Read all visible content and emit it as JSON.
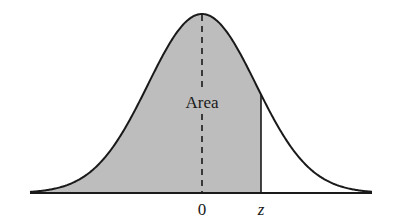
{
  "chart_data": {
    "type": "area",
    "title": "",
    "distribution": {
      "name": "standard normal",
      "mean": 0,
      "sd": 1
    },
    "shaded_region": {
      "from": "-inf",
      "to": "z"
    },
    "xlabel": "",
    "ylabel": "",
    "tick_labels": [
      "0",
      "z"
    ],
    "annotation": "Area",
    "grid": false,
    "legend": null,
    "colors": {
      "shade": "#bdbdbd",
      "curve": "#1a1a1a",
      "background": "#ffffff"
    }
  },
  "labels": {
    "area": "Area",
    "zero": "0",
    "z": "z"
  }
}
